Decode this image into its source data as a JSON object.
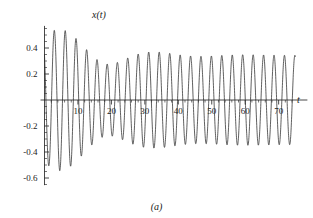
{
  "figure": {
    "caption": "(a)",
    "background_color": "#ffffff",
    "curve_color": "#2b2b2b",
    "axis_color": "#1a1a1a"
  },
  "chart_data": {
    "type": "line",
    "title": "",
    "subtitle": "",
    "xlabel": "t",
    "ylabel": "x(t)",
    "xlim": [
      0,
      75
    ],
    "ylim": [
      -0.66,
      0.58
    ],
    "grid": false,
    "legend": null,
    "annotations": [
      "(a)"
    ],
    "x_ticks_major": [
      10,
      20,
      30,
      40,
      50,
      60,
      70
    ],
    "x_tick_labels": [
      "10",
      "20",
      "30",
      "40",
      "50",
      "60",
      "70"
    ],
    "x_tick_minor_step": 2,
    "y_ticks_major": [
      0.4,
      0.2,
      -0.2,
      -0.4,
      -0.6
    ],
    "y_tick_labels": [
      "0.4",
      "0.2",
      "-0.2",
      "-0.4",
      "-0.6"
    ],
    "y_tick_minor_step": 0.05,
    "y_axis_zero_unlabeled": true,
    "model": {
      "steady_amplitude": 0.345,
      "steady_period": 3.12,
      "steady_phase": 1.62,
      "transient_amplitude": 0.3,
      "transient_period": 3.52,
      "transient_phase": 0.0,
      "transient_decay_tau": 13.5
    },
    "peak_envelope": {
      "t": [
        2.0,
        6.2,
        12.2,
        17.8,
        23.6,
        29.0,
        34.5,
        40.0,
        46.0,
        52.0,
        58.0,
        64.0,
        70.0,
        74.5
      ],
      "value": [
        0.35,
        0.52,
        0.53,
        0.47,
        0.41,
        0.38,
        0.36,
        0.36,
        0.35,
        0.35,
        0.35,
        0.35,
        0.35,
        0.35
      ]
    },
    "trough_envelope": {
      "t": [
        3.6,
        9.3,
        14.9,
        20.5,
        26.2,
        31.5,
        37.2,
        43.0,
        49.0,
        55.0,
        61.0,
        67.0,
        73.0
      ],
      "value": [
        -0.6,
        -0.46,
        -0.42,
        -0.38,
        -0.36,
        -0.35,
        -0.39,
        -0.33,
        -0.33,
        -0.33,
        -0.33,
        -0.33,
        -0.33
      ]
    }
  }
}
